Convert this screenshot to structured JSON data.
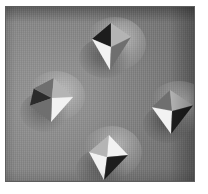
{
  "figure": {
    "kind": "micrograph",
    "modality": "scanning-probe / electron micrograph",
    "caption": "",
    "margin_color": "#ffffff",
    "frame_color": "#5d5d5d"
  },
  "image": {
    "width": 190,
    "height": 176,
    "background_color": "#7b7b7b",
    "substrate_light_color": "#868686",
    "substrate_dark_color": "#6d6d6d",
    "texture": "vertical scan striations",
    "illumination": "from lower-left"
  },
  "features": [
    {
      "id": "pyramid-top",
      "label": "top pyramid",
      "center_x": 105,
      "center_y": 40,
      "size": 50,
      "lit_face": "lower-left",
      "dark_face": "upper-left",
      "halo": "upper-right glow"
    },
    {
      "id": "pyramid-left",
      "label": "left pyramid",
      "center_x": 45,
      "center_y": 93,
      "size": 48,
      "lit_face": "right",
      "dark_face": "left",
      "halo": "upper-right glow"
    },
    {
      "id": "pyramid-right",
      "label": "right pyramid",
      "center_x": 167,
      "center_y": 105,
      "size": 48,
      "lit_face": "left",
      "dark_face": "right",
      "halo": "upper-right glow"
    },
    {
      "id": "pyramid-bottom",
      "label": "bottom pyramid",
      "center_x": 101,
      "center_y": 150,
      "size": 50,
      "lit_face": "lower-left",
      "dark_face": "lower-right",
      "halo": "upper-right glow"
    }
  ],
  "colors": {
    "face_dark": "#1d1d1d",
    "face_mid": "#6f6f6f",
    "face_lit": "#f2f2f2",
    "face_grey": "#b4b4b4",
    "shadow": "#2b2b2b"
  }
}
